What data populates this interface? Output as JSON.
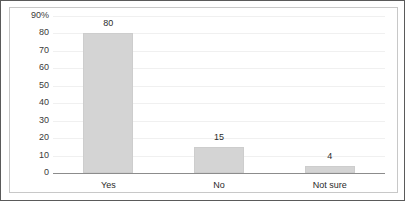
{
  "chart_data": {
    "type": "bar",
    "title": "",
    "subtitle": "",
    "xlabel": "",
    "ylabel": "",
    "categories": [
      "Yes",
      "No",
      "Not sure"
    ],
    "values": [
      80,
      15,
      4
    ],
    "value_labels": [
      "80",
      "15",
      "4"
    ],
    "ylim": [
      0,
      90
    ],
    "y_ticks": [
      0,
      10,
      20,
      30,
      40,
      50,
      60,
      70,
      80,
      90
    ],
    "y_tick_labels": [
      "0",
      "10",
      "20",
      "30",
      "40",
      "50",
      "60",
      "70",
      "80",
      "90%"
    ],
    "grid": true,
    "legend": false,
    "legend_position": "none",
    "series": [
      {
        "name": "",
        "values": [
          80,
          15,
          4
        ]
      }
    ],
    "colors": {
      "bar_fill": "#d4d4d4",
      "bar_border": "#cdcdcd",
      "axis_line": "#8c8c8c",
      "grid_line": "#f0f0f0",
      "text": "#2b2b2b",
      "frame": "#5a5a5a",
      "panel_border": "#c8c8c8"
    }
  }
}
